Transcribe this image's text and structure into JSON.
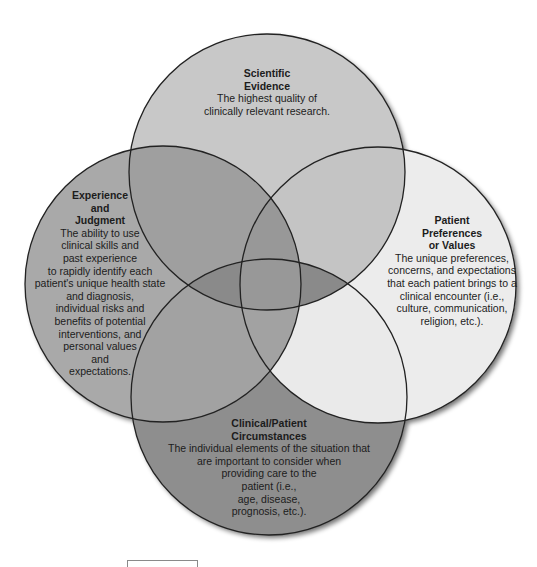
{
  "diagram": {
    "type": "venn",
    "colors": {
      "top_fill": "#c8c8c8",
      "left_fill": "#a9a9a9",
      "right_fill": "#ececec",
      "bottom_fill": "#8e8e8e",
      "outline": "#222222"
    },
    "circles": [
      {
        "id": "scientific-evidence",
        "title_lines": [
          "Scientific",
          "Evidence"
        ],
        "desc_lines": [
          "The highest quality of",
          "clinically relevant research."
        ]
      },
      {
        "id": "experience-judgment",
        "title_lines": [
          "Experience",
          "and",
          "Judgment"
        ],
        "desc_lines": [
          "The ability to use",
          "clinical skills and",
          "past experience",
          "to rapidly identify each",
          "patient's unique health state",
          "and diagnosis,",
          "individual risks and",
          "benefits of potential",
          "interventions, and",
          "personal values",
          "and",
          "expectations."
        ]
      },
      {
        "id": "patient-preferences",
        "title_lines": [
          "Patient",
          "Preferences",
          "or Values"
        ],
        "desc_lines": [
          "The unique preferences,",
          "concerns, and expectations",
          "that each patient brings to a",
          "clinical encounter (i.e.,",
          "culture, communication,",
          "religion, etc.)."
        ]
      },
      {
        "id": "clinical-circumstances",
        "title_lines": [
          "Clinical/Patient",
          "Circumstances"
        ],
        "desc_lines": [
          "The individual elements of the situation that",
          "are important to consider when",
          "providing care to the",
          "patient (i.e.,",
          "age, disease,",
          "prognosis, etc.)."
        ]
      }
    ]
  }
}
